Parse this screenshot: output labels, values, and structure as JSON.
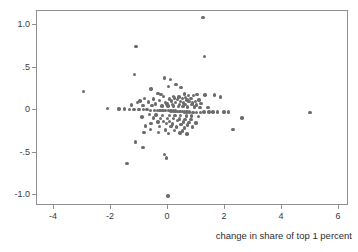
{
  "chart_data": {
    "type": "scatter",
    "title": "",
    "xlabel": "change in share of top 1 percent",
    "ylabel": "",
    "xlim": [
      -4.6,
      6.35
    ],
    "ylim": [
      -1.13,
      1.17
    ],
    "grid": false,
    "legend": null,
    "marker": {
      "color": "#6b6b6b",
      "shape": "circle",
      "size_px": 3.4
    },
    "xticks": [
      {
        "value": -4,
        "label": "-4"
      },
      {
        "value": -2,
        "label": "-2"
      },
      {
        "value": 0,
        "label": "0"
      },
      {
        "value": 2,
        "label": "2"
      },
      {
        "value": 4,
        "label": "4"
      },
      {
        "value": 6,
        "label": "6"
      }
    ],
    "yticks": [
      {
        "value": 1.0,
        "label": "1.0"
      },
      {
        "value": 0.5,
        "label": ".5"
      },
      {
        "value": 0.0,
        "label": "0"
      },
      {
        "value": -0.5,
        "label": "-.5"
      },
      {
        "value": -1.0,
        "label": "-1.0"
      }
    ],
    "points": [
      [
        1.22,
        1.09
      ],
      [
        -1.13,
        0.75
      ],
      [
        1.28,
        0.63
      ],
      [
        -1.17,
        0.42
      ],
      [
        -0.13,
        0.38
      ],
      [
        0.08,
        0.36
      ],
      [
        0.28,
        0.3
      ],
      [
        0.02,
        0.28
      ],
      [
        0.46,
        0.27
      ],
      [
        -0.6,
        0.25
      ],
      [
        -2.96,
        0.22
      ],
      [
        -0.35,
        0.2
      ],
      [
        0.58,
        0.19
      ],
      [
        -0.25,
        0.185
      ],
      [
        1.02,
        0.185
      ],
      [
        1.3,
        0.18
      ],
      [
        1.62,
        0.18
      ],
      [
        0.72,
        0.175
      ],
      [
        0.9,
        0.17
      ],
      [
        -0.16,
        0.165
      ],
      [
        1.84,
        0.155
      ],
      [
        0.18,
        0.16
      ],
      [
        0.38,
        0.155
      ],
      [
        0.62,
        0.15
      ],
      [
        -0.82,
        0.14
      ],
      [
        0.22,
        0.145
      ],
      [
        0.5,
        0.14
      ],
      [
        0.8,
        0.135
      ],
      [
        -0.52,
        0.13
      ],
      [
        0.05,
        0.13
      ],
      [
        0.34,
        0.125
      ],
      [
        0.66,
        0.12
      ],
      [
        1.08,
        0.12
      ],
      [
        -0.98,
        0.11
      ],
      [
        -0.3,
        0.115
      ],
      [
        0.12,
        0.11
      ],
      [
        0.44,
        0.105
      ],
      [
        0.74,
        0.1
      ],
      [
        0.96,
        0.1
      ],
      [
        -1.08,
        0.09
      ],
      [
        -0.68,
        0.095
      ],
      [
        -0.1,
        0.09
      ],
      [
        0.26,
        0.09
      ],
      [
        0.54,
        0.085
      ],
      [
        0.86,
        0.085
      ],
      [
        1.16,
        0.08
      ],
      [
        -0.44,
        0.075
      ],
      [
        -0.04,
        0.075
      ],
      [
        0.16,
        0.07
      ],
      [
        0.4,
        0.07
      ],
      [
        0.6,
        0.065
      ],
      [
        0.84,
        0.065
      ],
      [
        1.0,
        0.06
      ],
      [
        -1.28,
        0.06
      ],
      [
        -0.88,
        0.055
      ],
      [
        -0.56,
        0.055
      ],
      [
        -0.22,
        0.05
      ],
      [
        0.0,
        0.05
      ],
      [
        0.2,
        0.05
      ],
      [
        0.36,
        0.045
      ],
      [
        0.52,
        0.045
      ],
      [
        0.68,
        0.04
      ],
      [
        0.92,
        0.04
      ],
      [
        1.12,
        0.035
      ],
      [
        1.4,
        0.035
      ],
      [
        -2.12,
        0.02
      ],
      [
        -1.72,
        0.015
      ],
      [
        -1.52,
        0.015
      ],
      [
        -1.36,
        0.01
      ],
      [
        -1.2,
        0.01
      ],
      [
        -1.02,
        0.01
      ],
      [
        -0.86,
        0.005
      ],
      [
        -0.74,
        0.005
      ],
      [
        -0.62,
        0.0
      ],
      [
        -0.48,
        0.0
      ],
      [
        -0.38,
        0.0
      ],
      [
        -0.28,
        0.0
      ],
      [
        -0.18,
        -0.005
      ],
      [
        -0.08,
        -0.005
      ],
      [
        0.02,
        -0.005
      ],
      [
        0.1,
        -0.01
      ],
      [
        0.18,
        -0.01
      ],
      [
        0.26,
        -0.01
      ],
      [
        0.32,
        -0.015
      ],
      [
        0.42,
        -0.015
      ],
      [
        0.5,
        -0.015
      ],
      [
        0.58,
        -0.02
      ],
      [
        0.66,
        -0.02
      ],
      [
        0.76,
        -0.02
      ],
      [
        0.88,
        -0.025
      ],
      [
        1.0,
        -0.025
      ],
      [
        1.14,
        -0.025
      ],
      [
        1.26,
        -0.02
      ],
      [
        1.44,
        -0.02
      ],
      [
        1.58,
        -0.02
      ],
      [
        1.74,
        -0.02
      ],
      [
        1.96,
        -0.02
      ],
      [
        2.12,
        -0.02
      ],
      [
        4.98,
        -0.03
      ],
      [
        -0.66,
        -0.05
      ],
      [
        -0.42,
        -0.055
      ],
      [
        -0.2,
        -0.06
      ],
      [
        0.04,
        -0.06
      ],
      [
        0.24,
        -0.065
      ],
      [
        0.44,
        -0.065
      ],
      [
        0.64,
        -0.07
      ],
      [
        0.82,
        -0.07
      ],
      [
        1.06,
        -0.075
      ],
      [
        -0.92,
        -0.08
      ],
      [
        -0.52,
        -0.09
      ],
      [
        -0.26,
        -0.095
      ],
      [
        -0.02,
        -0.1
      ],
      [
        0.2,
        -0.1
      ],
      [
        0.4,
        -0.105
      ],
      [
        0.6,
        -0.11
      ],
      [
        0.8,
        -0.11
      ],
      [
        0.34,
        -0.125
      ],
      [
        0.06,
        -0.13
      ],
      [
        -0.16,
        -0.135
      ],
      [
        -0.36,
        -0.14
      ],
      [
        0.54,
        -0.14
      ],
      [
        0.74,
        -0.145
      ],
      [
        0.98,
        -0.15
      ],
      [
        -0.6,
        -0.155
      ],
      [
        -0.06,
        -0.16
      ],
      [
        0.16,
        -0.165
      ],
      [
        0.46,
        -0.17
      ],
      [
        0.68,
        -0.175
      ],
      [
        2.6,
        -0.09
      ],
      [
        -0.8,
        -0.185
      ],
      [
        -0.3,
        -0.19
      ],
      [
        0.1,
        -0.195
      ],
      [
        0.3,
        -0.2
      ],
      [
        0.58,
        -0.21
      ],
      [
        0.86,
        -0.2
      ],
      [
        -0.62,
        -0.23
      ],
      [
        -0.1,
        -0.235
      ],
      [
        0.22,
        -0.24
      ],
      [
        0.5,
        -0.245
      ],
      [
        2.28,
        -0.23
      ],
      [
        -0.84,
        -0.26
      ],
      [
        -0.34,
        -0.265
      ],
      [
        0.02,
        -0.275
      ],
      [
        0.42,
        -0.27
      ],
      [
        0.66,
        -0.28
      ],
      [
        -1.14,
        -0.375
      ],
      [
        -0.88,
        -0.44
      ],
      [
        -0.12,
        -0.52
      ],
      [
        -0.06,
        -0.565
      ],
      [
        -1.44,
        -0.63
      ],
      [
        0.0,
        -1.01
      ]
    ]
  }
}
